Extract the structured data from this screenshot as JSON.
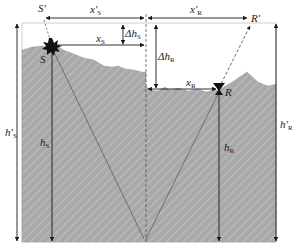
{
  "diagram": {
    "type": "seismic-source-receiver-geometry",
    "colors": {
      "terrain_fill": "#a8a8a8",
      "terrain_hatch": "#bdbdbd",
      "line": "#1a1a1a",
      "frame": "#b0b0b0",
      "background": "#ffffff"
    },
    "labels": {
      "source": "S",
      "source_projected": "S′",
      "receiver": "R",
      "receiver_projected": "R′",
      "x_s_prime": {
        "main": "x′",
        "sub": "S"
      },
      "x_r_prime": {
        "main": "x′",
        "sub": "R"
      },
      "x_s": {
        "main": "x",
        "sub": "S"
      },
      "x_r": {
        "main": "x",
        "sub": "R"
      },
      "delta_h_s": {
        "main": "Δh",
        "sub": "S"
      },
      "delta_h_r": {
        "main": "Δh",
        "sub": "R"
      },
      "h_s": {
        "main": "h",
        "sub": "S"
      },
      "h_r": {
        "main": "h",
        "sub": "R"
      },
      "h_s_prime": {
        "main": "h′",
        "sub": "S"
      },
      "h_r_prime": {
        "main": "h′",
        "sub": "R"
      }
    }
  }
}
